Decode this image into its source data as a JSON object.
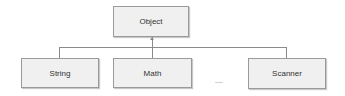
{
  "diagram": {
    "type": "class-hierarchy",
    "root": {
      "label": "Object"
    },
    "children": [
      {
        "label": "String"
      },
      {
        "label": "Math"
      },
      {
        "label": "Scanner"
      }
    ],
    "ellipsis": "....",
    "colors": {
      "box_fill": "#f0f0f0",
      "box_border": "#9a9a9a",
      "connector": "#8a8a8a"
    }
  }
}
